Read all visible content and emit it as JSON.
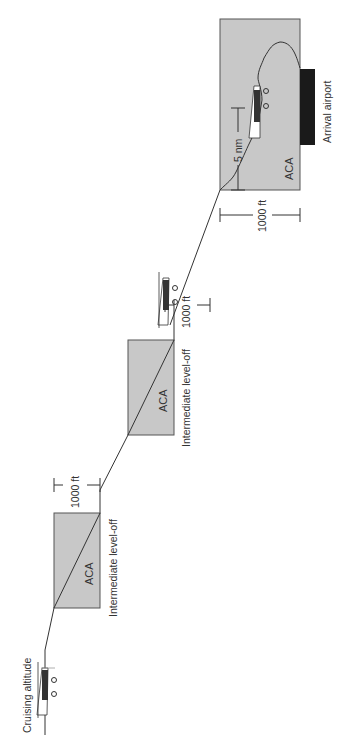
{
  "diagram": {
    "orientation": "rotated 90 degrees counter-clockwise (read with head tilted left)",
    "labels": {
      "cruising": "Cruising altitude",
      "level_off_1": "Intermediate level-off",
      "level_off_2": "Intermediate level-off",
      "arrival": "Arrival airport"
    },
    "aca_boxes": [
      {
        "label": "ACA"
      },
      {
        "label": "ACA"
      },
      {
        "label": "ACA"
      }
    ],
    "dimensions": {
      "alt_1": "1000 ft",
      "alt_2": "1000 ft",
      "alt_3": "1000 ft",
      "distance": "5 nm"
    },
    "colors": {
      "aca_fill": "#c8c8c8",
      "runway": "#1a1a1a",
      "line": "#333333"
    }
  }
}
